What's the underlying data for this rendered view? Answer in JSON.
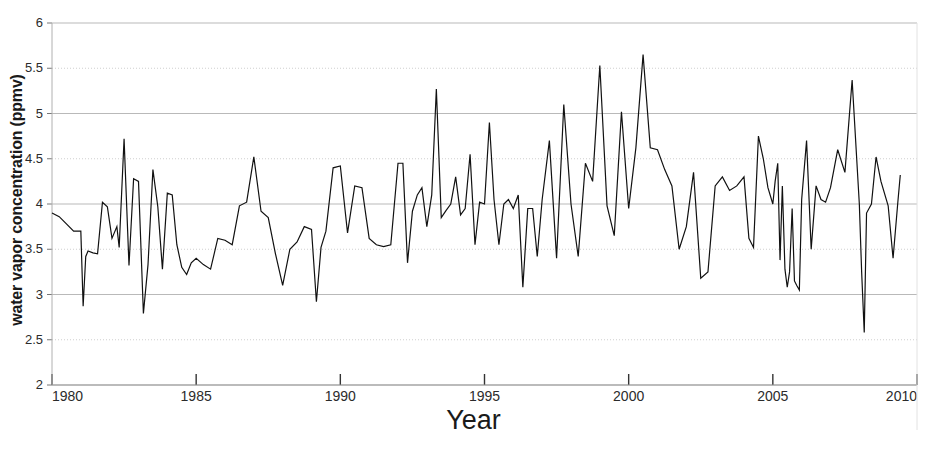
{
  "chart_data": {
    "type": "line",
    "title": "",
    "xlabel": "Year",
    "ylabel": "water vapor concentration (ppmv)",
    "xlim": [
      1980,
      2010
    ],
    "ylim": [
      2,
      6
    ],
    "xticks": [
      1980,
      1985,
      1990,
      1995,
      2000,
      2005,
      2010
    ],
    "xtick_labels": [
      "1980",
      "1985",
      "1990",
      "1995",
      "2000",
      "2005",
      "2010"
    ],
    "yticks": [
      2,
      2.5,
      3,
      3.5,
      4,
      4.5,
      5,
      5.5,
      6
    ],
    "ytick_labels": [
      "2",
      "2.5",
      "3",
      "3.5",
      "4",
      "4.5",
      "5",
      "5.5",
      "6"
    ],
    "grid": true,
    "grid_axis": "y",
    "legend": "none",
    "line_color": "#111111",
    "line_width": 1.2,
    "series": [
      {
        "name": "water vapor concentration",
        "x": [
          1980.0,
          1980.25,
          1980.5,
          1980.75,
          1981.0,
          1981.08,
          1981.17,
          1981.25,
          1981.42,
          1981.58,
          1981.75,
          1981.92,
          1982.08,
          1982.25,
          1982.33,
          1982.5,
          1982.67,
          1982.83,
          1983.0,
          1983.17,
          1983.33,
          1983.5,
          1983.67,
          1983.83,
          1984.0,
          1984.17,
          1984.33,
          1984.5,
          1984.67,
          1984.83,
          1985.0,
          1985.25,
          1985.5,
          1985.75,
          1986.0,
          1986.25,
          1986.5,
          1986.75,
          1987.0,
          1987.25,
          1987.5,
          1987.75,
          1988.0,
          1988.25,
          1988.5,
          1988.75,
          1989.0,
          1989.17,
          1989.33,
          1989.5,
          1989.75,
          1990.0,
          1990.25,
          1990.5,
          1990.75,
          1991.0,
          1991.25,
          1991.5,
          1991.75,
          1992.0,
          1992.17,
          1992.33,
          1992.5,
          1992.67,
          1992.83,
          1993.0,
          1993.17,
          1993.33,
          1993.5,
          1993.67,
          1993.83,
          1994.0,
          1994.17,
          1994.33,
          1994.5,
          1994.67,
          1994.83,
          1995.0,
          1995.17,
          1995.33,
          1995.5,
          1995.67,
          1995.83,
          1996.0,
          1996.17,
          1996.33,
          1996.5,
          1996.67,
          1996.83,
          1997.0,
          1997.25,
          1997.5,
          1997.75,
          1998.0,
          1998.25,
          1998.5,
          1998.75,
          1999.0,
          1999.25,
          1999.5,
          1999.75,
          2000.0,
          2000.25,
          2000.5,
          2000.75,
          2001.0,
          2001.25,
          2001.5,
          2001.75,
          2002.0,
          2002.25,
          2002.5,
          2002.75,
          2003.0,
          2003.25,
          2003.5,
          2003.75,
          2004.0,
          2004.17,
          2004.33,
          2004.5,
          2004.67,
          2004.83,
          2005.0,
          2005.08,
          2005.17,
          2005.25,
          2005.33,
          2005.42,
          2005.5,
          2005.58,
          2005.67,
          2005.75,
          2005.83,
          2005.92,
          2006.0,
          2006.17,
          2006.33,
          2006.5,
          2006.67,
          2006.83,
          2007.0,
          2007.25,
          2007.5,
          2007.75,
          2008.0,
          2008.08,
          2008.17,
          2008.25,
          2008.42,
          2008.58,
          2008.75,
          2009.0,
          2009.17,
          2009.33,
          2009.42
        ],
        "values": [
          3.9,
          3.86,
          3.78,
          3.7,
          3.7,
          2.87,
          3.42,
          3.48,
          3.46,
          3.45,
          4.02,
          3.97,
          3.62,
          3.75,
          3.52,
          4.72,
          3.32,
          4.28,
          4.25,
          2.79,
          3.33,
          4.38,
          3.97,
          3.28,
          4.12,
          4.1,
          3.55,
          3.3,
          3.22,
          3.35,
          3.4,
          3.33,
          3.28,
          3.62,
          3.6,
          3.55,
          3.98,
          4.02,
          4.52,
          3.92,
          3.85,
          3.45,
          3.1,
          3.5,
          3.58,
          3.75,
          3.72,
          2.92,
          3.52,
          3.7,
          4.4,
          4.42,
          3.68,
          4.2,
          4.18,
          3.62,
          3.55,
          3.53,
          3.55,
          4.45,
          4.45,
          3.35,
          3.92,
          4.1,
          4.18,
          3.75,
          4.1,
          5.27,
          3.85,
          3.93,
          4.0,
          4.3,
          3.88,
          3.95,
          4.55,
          3.55,
          4.02,
          4.0,
          4.9,
          4.05,
          3.55,
          4.0,
          4.05,
          3.95,
          4.1,
          3.08,
          3.95,
          3.95,
          3.42,
          4.05,
          4.7,
          3.4,
          5.1,
          4.0,
          3.42,
          4.45,
          4.25,
          5.53,
          3.98,
          3.65,
          5.02,
          3.95,
          4.62,
          5.65,
          4.62,
          4.6,
          4.38,
          4.2,
          3.5,
          3.75,
          4.35,
          3.18,
          3.25,
          4.2,
          4.3,
          4.15,
          4.2,
          4.3,
          3.62,
          3.52,
          4.75,
          4.5,
          4.18,
          4.0,
          4.25,
          4.45,
          3.38,
          4.2,
          3.28,
          3.08,
          3.25,
          3.95,
          3.15,
          3.1,
          3.05,
          4.05,
          4.7,
          3.5,
          4.2,
          4.05,
          4.02,
          4.18,
          4.6,
          4.35,
          5.37,
          4.0,
          3.25,
          2.58,
          3.9,
          4.0,
          4.52,
          4.25,
          3.98,
          3.4,
          4.0,
          4.32
        ]
      }
    ]
  },
  "axes": {
    "x_axis_name": "Year",
    "y_axis_name": "water vapor concentration (ppmv)"
  }
}
